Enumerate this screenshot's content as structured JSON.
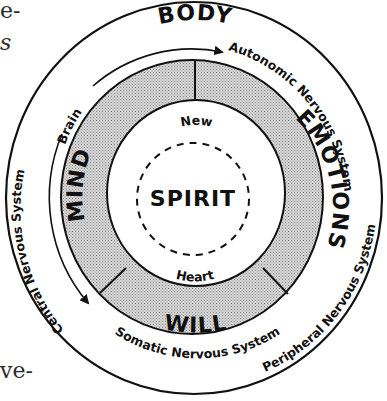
{
  "page_fragments": {
    "top_left_1": "e-",
    "top_left_2": "s",
    "bottom_left": "ve-"
  },
  "diagram": {
    "outer_ring": {
      "label": "BODY",
      "arcs": [
        {
          "label": "Autonomic Nervous System"
        },
        {
          "label": "Peripheral Nervous System"
        },
        {
          "label": "Central Nervous System"
        },
        {
          "label": "Somatic Nervous System"
        },
        {
          "label": "Brain"
        }
      ]
    },
    "soul_ring": {
      "segments": [
        {
          "label": "MIND"
        },
        {
          "label": "EMOTIONS"
        },
        {
          "label": "WILL"
        }
      ]
    },
    "center": {
      "label": "SPIRIT",
      "top_label": "New",
      "bottom_label": "Heart"
    },
    "colors": {
      "line": "#111111",
      "shade": "#c9c9c9",
      "background": "#ffffff"
    }
  }
}
